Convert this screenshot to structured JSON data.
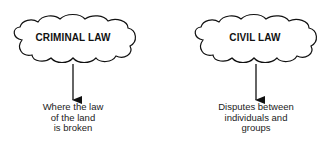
{
  "nodes": [
    {
      "id": "criminal",
      "title": "CRIMINAL LAW",
      "description_lines": [
        "Where the law",
        "of the land",
        "is broken"
      ]
    },
    {
      "id": "civil",
      "title": "CIVIL LAW",
      "description_lines": [
        "Disputes between",
        "individuals and",
        "groups"
      ]
    }
  ],
  "colors": {
    "stroke": "#111111",
    "background": "#ffffff"
  }
}
